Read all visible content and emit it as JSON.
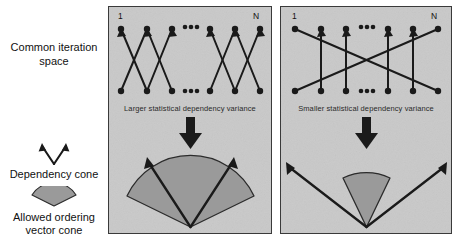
{
  "legend": {
    "title_line1": "Common iteration",
    "title_line2": "space",
    "dependency_cone": {
      "icon": "v-arrow-cone-icon",
      "label": "Dependency cone"
    },
    "ordering_cone": {
      "icon": "shaded-fan-cone-icon",
      "label_line1": "Allowed ordering",
      "label_line2": "vector cone"
    }
  },
  "panels": [
    {
      "id": "panel-larger-variance",
      "caption": "Larger statistical dependency variance",
      "start_label": "1",
      "end_label": "N",
      "ellipsis": "•••",
      "arrow_icon": "down-arrow-icon",
      "dependency_pattern": "short-crossing-edges",
      "cone_half_angle_deg": 47,
      "cone_shaded_half_angle_deg": 40,
      "node_count_visible": 6
    },
    {
      "id": "panel-smaller-variance",
      "caption": "Smaller statistical dependency variance",
      "start_label": "1",
      "end_label": "N",
      "ellipsis": "•••",
      "arrow_icon": "down-arrow-icon",
      "dependency_pattern": "vertical-edges-with-two-long-diagonals",
      "cone_half_angle_deg": 47,
      "cone_shaded_half_angle_deg": 19,
      "node_count_visible": 6
    }
  ],
  "colors": {
    "panel_background": "#c9c9c9",
    "panel_border": "#3a3a3a",
    "ink": "#1a1a1a",
    "cone_fill": "#9a9a9a",
    "cone_stroke": "#2b2b2b"
  }
}
